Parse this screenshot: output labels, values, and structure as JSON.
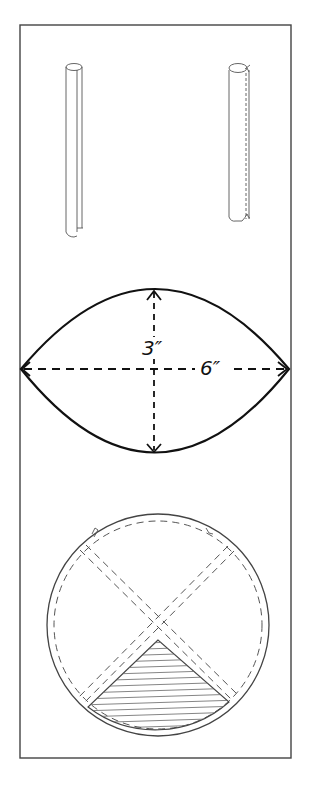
{
  "diagram": {
    "panels": [
      {
        "id": "tubes",
        "description": "two rolled paper tubes"
      },
      {
        "id": "lens",
        "description": "pointed oval pattern with dimension arrows"
      },
      {
        "id": "circle",
        "description": "circle divided by crossing dashed strips with shaded bottom wedge"
      }
    ],
    "dimensions": {
      "height_label": "3″",
      "width_label": "6″"
    },
    "colors": {
      "ink": "#111111",
      "frame": "#444444",
      "background": "#ffffff",
      "hatch": "#666666"
    }
  }
}
